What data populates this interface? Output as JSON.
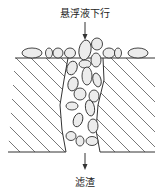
{
  "diagram": {
    "type": "filtration-schematic",
    "labels": {
      "top": "悬浮液下行",
      "bottom": "滤渣"
    },
    "elements": {
      "inflow_arrow": "arrow-down",
      "outflow_arrow": "arrow-down",
      "filter_medium": "hatched-medium",
      "pore_channel": "channel-with-bridged-particles",
      "surface_particles": "ellipses-on-surface"
    },
    "colors": {
      "line": "#333333",
      "particle_fill": "#ececec",
      "background": "#ffffff"
    }
  }
}
